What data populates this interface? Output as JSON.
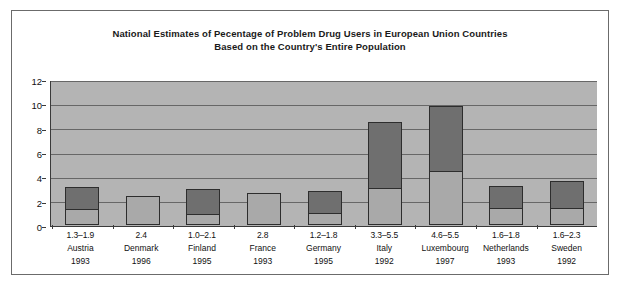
{
  "chart_data": {
    "type": "bar",
    "title": "National Estimates of Pecentage of Problem Drug Users in European Union Countries",
    "subtitle": "Based on the Country's Entire Population",
    "xlabel": "",
    "ylabel": "",
    "ylim": [
      0,
      12
    ],
    "ytick_labels": [
      "12",
      "10",
      "8",
      "6",
      "4",
      "2",
      "0"
    ],
    "ytick_values": [
      12,
      10,
      8,
      6,
      4,
      2,
      0
    ],
    "grid": true,
    "legend": "none",
    "stacked": true,
    "series": [
      {
        "name": "low estimate (light segment)",
        "values": [
          1.3,
          2.4,
          0.85,
          2.65,
          1.0,
          3.1,
          4.45,
          1.4,
          1.4
        ]
      },
      {
        "name": "high estimate (dark segment top)",
        "values": [
          3.15,
          2.4,
          3.0,
          2.65,
          2.85,
          8.6,
          9.95,
          3.25,
          3.65
        ]
      }
    ],
    "categories": [
      "Austria",
      "Denmark",
      "Finland",
      "France",
      "Germany",
      "Italy",
      "Luxembourg",
      "Netherlands",
      "Sweden"
    ],
    "bars": [
      {
        "country": "Austria",
        "range": "1.3–1.9",
        "year": "1993",
        "low": 1.3,
        "high": 3.15,
        "split": true
      },
      {
        "country": "Denmark",
        "range": "2.4",
        "year": "1996",
        "low": 2.4,
        "high": 2.4,
        "split": false
      },
      {
        "country": "Finland",
        "range": "1.0–2.1",
        "year": "1995",
        "low": 0.85,
        "high": 3.0,
        "split": true
      },
      {
        "country": "France",
        "range": "2.8",
        "year": "1993",
        "low": 2.65,
        "high": 2.65,
        "split": false
      },
      {
        "country": "Germany",
        "range": "1.2–1.8",
        "year": "1995",
        "low": 1.0,
        "high": 2.85,
        "split": true
      },
      {
        "country": "Italy",
        "range": "3.3–5.5",
        "year": "1992",
        "low": 3.1,
        "high": 8.6,
        "split": true
      },
      {
        "country": "Luxembourg",
        "range": "4.6–5.5",
        "year": "1997",
        "low": 4.45,
        "high": 9.95,
        "split": true
      },
      {
        "country": "Netherlands",
        "range": "1.6–1.8",
        "year": "1993",
        "low": 1.4,
        "high": 3.25,
        "split": true
      },
      {
        "country": "Sweden",
        "range": "1.6–2.3",
        "year": "1992",
        "low": 1.4,
        "high": 3.65,
        "split": true
      }
    ],
    "colors": {
      "plot_background": "#b4b4b4",
      "gridline": "#676767",
      "bar_light": "#a9a9a9",
      "bar_dark": "#6f6f6f",
      "bar_border": "#2d2d2d",
      "frame_border": "#6b6b6b",
      "text": "#111111",
      "page_background": "#ffffff"
    }
  }
}
